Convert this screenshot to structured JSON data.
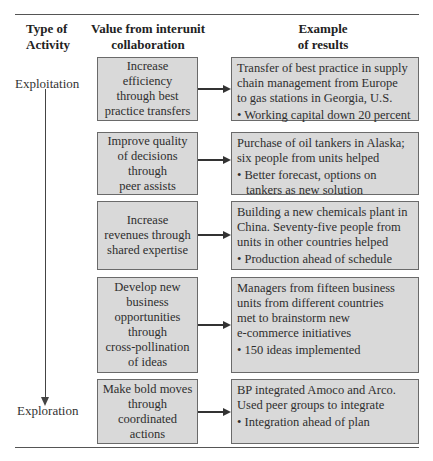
{
  "headers": {
    "type_of_activity": [
      "Type of",
      "Activity"
    ],
    "value": [
      "Value from interunit",
      "collaboration"
    ],
    "example": [
      "Example",
      "of results"
    ]
  },
  "axis": {
    "top_label": "Exploitation",
    "bottom_label": "Exploration"
  },
  "rows": [
    {
      "value_lines": [
        "Increase",
        "efficiency",
        "through best",
        "practice transfers"
      ],
      "result_lines": [
        "Transfer of best practice in supply",
        "chain management from Europe",
        "to gas stations in Georgia, U.S."
      ],
      "bullet_lines": [
        "• Working capital down 20 percent"
      ]
    },
    {
      "value_lines": [
        "Improve quality",
        "of decisions",
        "through",
        "peer assists"
      ],
      "result_lines": [
        "Purchase of oil tankers in Alaska;",
        "six people from units helped"
      ],
      "bullet_lines": [
        "• Better forecast, options on",
        "tankers as new solution"
      ]
    },
    {
      "value_lines": [
        "Increase",
        "revenues through",
        "shared expertise"
      ],
      "result_lines": [
        "Building a new chemicals plant in",
        "China. Seventy-five people from",
        "units in other countries helped"
      ],
      "bullet_lines": [
        "• Production ahead of schedule"
      ]
    },
    {
      "value_lines": [
        "Develop new",
        "business",
        "opportunities",
        "through",
        "cross-pollination",
        "of ideas"
      ],
      "result_lines": [
        "Managers from fifteen business",
        "units from different countries",
        "met to brainstorm new",
        "e-commerce initiatives"
      ],
      "bullet_lines": [
        "• 150 ideas implemented"
      ]
    },
    {
      "value_lines": [
        "Make bold moves",
        "through",
        "coordinated",
        "actions"
      ],
      "result_lines": [
        "BP integrated Amoco and Arco.",
        "Used peer groups to integrate"
      ],
      "bullet_lines": [
        "• Integration ahead of plan"
      ]
    }
  ],
  "colors": {
    "box_fill": "#d9d9d9",
    "box_border": "#6a6a6a",
    "rule": "#555555",
    "arrow": "#333333"
  }
}
